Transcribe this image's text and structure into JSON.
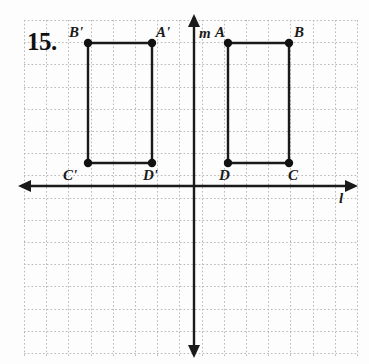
{
  "problem": {
    "number": "15."
  },
  "grid": {
    "left": 24,
    "top": 20,
    "right": 357,
    "bottom": 357,
    "cell": 22.2,
    "line_color": "#b9b9b9",
    "style": "dotted"
  },
  "axes": {
    "horizontal": {
      "name": "l",
      "label": "l",
      "y": 186,
      "x_start": 26,
      "x_end": 350,
      "arrow_left": true,
      "arrow_right": true,
      "label_x": 339,
      "label_y": 191
    },
    "vertical": {
      "name": "m",
      "label": "m",
      "x": 194,
      "y_start": 22,
      "y_end": 350,
      "arrow_up": true,
      "arrow_down": true,
      "label_x": 199,
      "label_y": 26
    },
    "color": "#1a1a1a"
  },
  "figures": [
    {
      "name": "original-rectangle",
      "id": "ABCD",
      "vertices": [
        {
          "label": "A",
          "x": 228,
          "y": 43,
          "label_x": 215,
          "label_y": 25
        },
        {
          "label": "B",
          "x": 289,
          "y": 43,
          "label_x": 294,
          "label_y": 25
        },
        {
          "label": "C",
          "x": 289,
          "y": 163,
          "label_x": 288,
          "label_y": 168
        },
        {
          "label": "D",
          "x": 228,
          "y": 163,
          "label_x": 219,
          "label_y": 168
        }
      ]
    },
    {
      "name": "image-rectangle",
      "id": "A'B'C'D'",
      "vertices": [
        {
          "label": "A'",
          "x": 152,
          "y": 43,
          "label_x": 156,
          "label_y": 25
        },
        {
          "label": "B'",
          "x": 88,
          "y": 43,
          "label_x": 69,
          "label_y": 25
        },
        {
          "label": "C'",
          "x": 88,
          "y": 163,
          "label_x": 63,
          "label_y": 168
        },
        {
          "label": "D'",
          "x": 152,
          "y": 163,
          "label_x": 143,
          "label_y": 168
        }
      ]
    }
  ],
  "style": {
    "shape_stroke": "#1a1a1a",
    "shape_stroke_width": 2.4,
    "vertex_radius": 4.2,
    "vertex_fill": "#111111",
    "axis_stroke_width": 2.4
  }
}
